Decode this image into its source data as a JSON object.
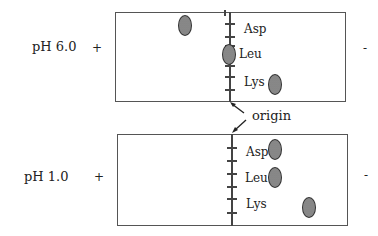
{
  "panels": [
    {
      "ph_label": "pH 6.0",
      "anode_sign": "+",
      "cathode_sign": "-",
      "amino_acids": [
        {
          "name": "Asp",
          "spot_position": "left of origin (toward +)"
        },
        {
          "name": "Leu",
          "spot_position": "at origin"
        },
        {
          "name": "Lys",
          "spot_position": "right of origin (toward -)"
        }
      ]
    },
    {
      "ph_label": "pH 1.0",
      "anode_sign": "+",
      "cathode_sign": "-",
      "amino_acids": [
        {
          "name": "Asp",
          "spot_position": "slightly right of origin"
        },
        {
          "name": "Leu",
          "spot_position": "slightly right of origin"
        },
        {
          "name": "Lys",
          "spot_position": "far right of origin (toward -)"
        }
      ]
    }
  ],
  "origin_label": "origin",
  "colors": {
    "border": "#555555",
    "spot_fill": "#9a9a9a",
    "text": "#222222"
  }
}
